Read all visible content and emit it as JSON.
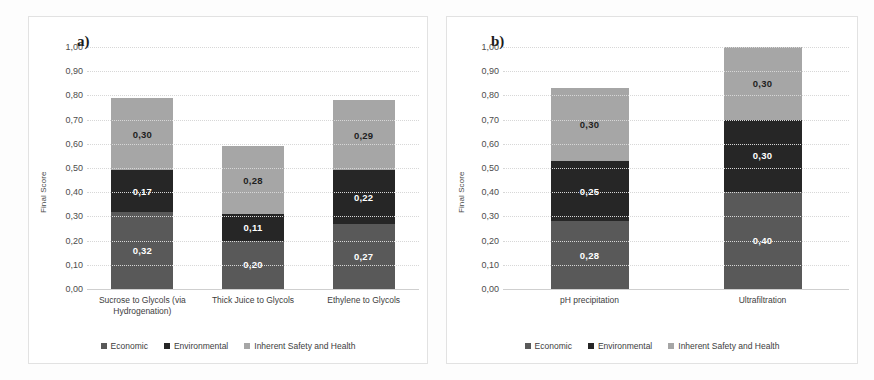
{
  "figure": {
    "background": "#ffffff",
    "panel_border": "#e2e2e2"
  },
  "colors": {
    "economic": "#595959",
    "environmental": "#262626",
    "safety": "#a6a6a6",
    "gridline": "#d7d7d7",
    "text": "#3d3d3d"
  },
  "panel_a": {
    "tag": "a)",
    "ylabel": "Final Score",
    "yticks": [
      "1,00",
      "0,90",
      "0,80",
      "0,70",
      "0,60",
      "0,50",
      "0,40",
      "0,30",
      "0,20",
      "0,10",
      "0,00"
    ],
    "categories": [
      "Sucrose to Glycols (via Hydrogenation)",
      "Thick Juice to Glycols",
      "Ethylene to Glycols"
    ],
    "labels": {
      "economic": [
        "0,32",
        "0,20",
        "0,27"
      ],
      "environmental": [
        "0,17",
        "0,11",
        "0,22"
      ],
      "safety": [
        "0,30",
        "0,28",
        "0,29"
      ]
    },
    "legend": [
      "Economic",
      "Environmental",
      "Inherent Safety and Health"
    ]
  },
  "panel_b": {
    "tag": "b)",
    "ylabel": "Final Score",
    "yticks": [
      "1,00",
      "0,90",
      "0,80",
      "0,70",
      "0,60",
      "0,50",
      "0,40",
      "0,30",
      "0,20",
      "0,10",
      "0,00"
    ],
    "categories": [
      "pH precipitation",
      "Ultrafiltration"
    ],
    "labels": {
      "economic": [
        "0,28",
        "0,40"
      ],
      "environmental": [
        "0,25",
        "0,30"
      ],
      "safety": [
        "0,30",
        "0,30"
      ]
    },
    "legend": [
      "Economic",
      "Environmental",
      "Inherent Safety and Health"
    ]
  },
  "chart_data": [
    {
      "type": "bar",
      "stacked": true,
      "panel": "a)",
      "title": "",
      "xlabel": "",
      "ylabel": "Final Score",
      "ylim": [
        0,
        1.0
      ],
      "ytick_values": [
        0.0,
        0.1,
        0.2,
        0.3,
        0.4,
        0.5,
        0.6,
        0.7,
        0.8,
        0.9,
        1.0
      ],
      "ytick_labels": [
        "0,00",
        "0,10",
        "0,20",
        "0,30",
        "0,40",
        "0,50",
        "0,60",
        "0,70",
        "0,80",
        "0,90",
        "1,00"
      ],
      "decimal_separator": ",",
      "grid": true,
      "legend_position": "bottom",
      "categories": [
        "Sucrose to Glycols (via Hydrogenation)",
        "Thick Juice to Glycols",
        "Ethylene to Glycols"
      ],
      "series": [
        {
          "name": "Economic",
          "color": "#595959",
          "values": [
            0.32,
            0.2,
            0.27
          ]
        },
        {
          "name": "Environmental",
          "color": "#262626",
          "values": [
            0.17,
            0.11,
            0.22
          ]
        },
        {
          "name": "Inherent Safety and Health",
          "color": "#a6a6a6",
          "values": [
            0.3,
            0.28,
            0.29
          ]
        }
      ],
      "totals": [
        0.79,
        0.59,
        0.78
      ]
    },
    {
      "type": "bar",
      "stacked": true,
      "panel": "b)",
      "title": "",
      "xlabel": "",
      "ylabel": "Final Score",
      "ylim": [
        0,
        1.0
      ],
      "ytick_values": [
        0.0,
        0.1,
        0.2,
        0.3,
        0.4,
        0.5,
        0.6,
        0.7,
        0.8,
        0.9,
        1.0
      ],
      "ytick_labels": [
        "0,00",
        "0,10",
        "0,20",
        "0,30",
        "0,40",
        "0,50",
        "0,60",
        "0,70",
        "0,80",
        "0,90",
        "1,00"
      ],
      "decimal_separator": ",",
      "grid": true,
      "legend_position": "bottom",
      "categories": [
        "pH precipitation",
        "Ultrafiltration"
      ],
      "series": [
        {
          "name": "Economic",
          "color": "#595959",
          "values": [
            0.28,
            0.4
          ]
        },
        {
          "name": "Environmental",
          "color": "#262626",
          "values": [
            0.25,
            0.3
          ]
        },
        {
          "name": "Inherent Safety and Health",
          "color": "#a6a6a6",
          "values": [
            0.3,
            0.3
          ]
        }
      ],
      "totals": [
        0.83,
        1.0
      ]
    }
  ]
}
